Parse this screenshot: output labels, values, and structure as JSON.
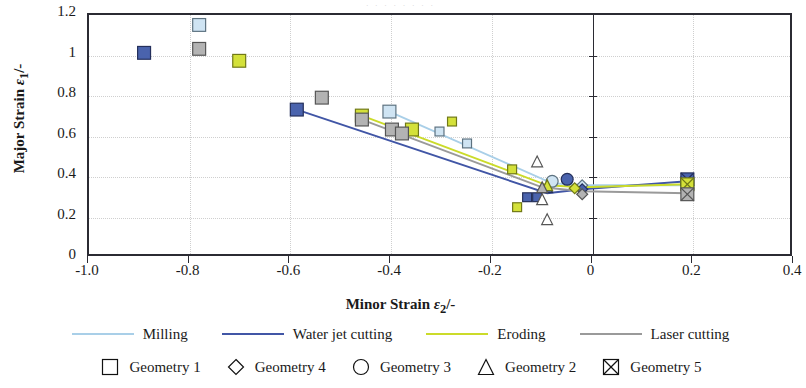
{
  "figure": {
    "top_clipped_text": "· · · · · · · ·"
  },
  "chart_data": {
    "type": "scatter",
    "title": "",
    "xlabel": "Minor Strain ε₂/-",
    "ylabel": "Major Strain ε₁/-",
    "xlabel_parts": {
      "text": "Minor Strain ",
      "symbol": "ε",
      "sub": "2",
      "suffix": "/-"
    },
    "ylabel_parts": {
      "text": "Major Strain ",
      "symbol": "ε",
      "sub": "1",
      "suffix": "/-"
    },
    "xlim": [
      -1.0,
      0.4
    ],
    "ylim": [
      0,
      1.2
    ],
    "xticks": [
      "-1.0",
      "-0.8",
      "-0.6",
      "-0.4",
      "-0.2",
      "0",
      "0.2",
      "0.4"
    ],
    "xtick_values": [
      -1.0,
      -0.8,
      -0.6,
      -0.4,
      -0.2,
      0,
      0.2,
      0.4
    ],
    "yticks": [
      "0",
      "0.2",
      "0.4",
      "0.6",
      "0.8",
      "1",
      "1.2"
    ],
    "ytick_values": [
      0,
      0.2,
      0.4,
      0.6,
      0.8,
      1.0,
      1.2
    ],
    "grid": "dotted-both",
    "zero_axis_x": 0,
    "legend_position": "below-plot",
    "colors": {
      "milling": "#a9cfe8",
      "water_jet_cutting": "#4156a6",
      "eroding": "#cbdb2a",
      "laser_cutting": "#9a9a9a"
    },
    "series": [
      {
        "name": "Milling",
        "color": "#a9cfe8",
        "marker_fill": "#cfe4f3",
        "line": [
          {
            "x": -0.4,
            "y": 0.715
          },
          {
            "x": -0.075,
            "y": 0.355
          },
          {
            "x": -0.005,
            "y": 0.345
          },
          {
            "x": 0.195,
            "y": 0.345
          }
        ],
        "points": [
          {
            "x": -0.78,
            "y": 1.15,
            "geometry": "Geometry 1",
            "marker": "square"
          },
          {
            "x": -0.4,
            "y": 0.715,
            "geometry": "Geometry 1",
            "marker": "square"
          },
          {
            "x": -0.3,
            "y": 0.615,
            "geometry": "Geometry 1",
            "marker": "square"
          },
          {
            "x": -0.245,
            "y": 0.555,
            "geometry": "Geometry 1",
            "marker": "square"
          },
          {
            "x": -0.075,
            "y": 0.365,
            "geometry": "Geometry 3",
            "marker": "circle"
          },
          {
            "x": -0.015,
            "y": 0.345,
            "geometry": "Geometry 4",
            "marker": "diamond"
          },
          {
            "x": 0.195,
            "y": 0.355,
            "geometry": "Geometry 5",
            "marker": "crossbox"
          }
        ]
      },
      {
        "name": "Water jet cutting",
        "color": "#4156a6",
        "marker_fill": "#4a63ad",
        "line": [
          {
            "x": -0.585,
            "y": 0.725
          },
          {
            "x": -0.085,
            "y": 0.305
          },
          {
            "x": -0.015,
            "y": 0.325
          },
          {
            "x": 0.195,
            "y": 0.365
          }
        ],
        "points": [
          {
            "x": -0.89,
            "y": 1.01,
            "geometry": "Geometry 1",
            "marker": "square"
          },
          {
            "x": -0.585,
            "y": 0.725,
            "geometry": "Geometry 1",
            "marker": "square"
          },
          {
            "x": -0.125,
            "y": 0.285,
            "geometry": "Geometry 1",
            "marker": "square"
          },
          {
            "x": -0.105,
            "y": 0.285,
            "geometry": "Geometry 1",
            "marker": "square"
          },
          {
            "x": -0.085,
            "y": 0.335,
            "geometry": "Geometry 2",
            "marker": "triangle"
          },
          {
            "x": -0.045,
            "y": 0.375,
            "geometry": "Geometry 3",
            "marker": "circle"
          },
          {
            "x": -0.015,
            "y": 0.325,
            "geometry": "Geometry 4",
            "marker": "diamond"
          },
          {
            "x": 0.195,
            "y": 0.375,
            "geometry": "Geometry 5",
            "marker": "crossbox"
          }
        ]
      },
      {
        "name": "Eroding",
        "color": "#cbdb2a",
        "marker_fill": "#d4e13a",
        "line": [
          {
            "x": -0.455,
            "y": 0.695
          },
          {
            "x": -0.085,
            "y": 0.345
          },
          {
            "x": -0.015,
            "y": 0.335
          },
          {
            "x": 0.195,
            "y": 0.35
          }
        ],
        "points": [
          {
            "x": -0.7,
            "y": 0.97,
            "geometry": "Geometry 1",
            "marker": "square"
          },
          {
            "x": -0.455,
            "y": 0.695,
            "geometry": "Geometry 1",
            "marker": "square"
          },
          {
            "x": -0.355,
            "y": 0.625,
            "geometry": "Geometry 1",
            "marker": "square"
          },
          {
            "x": -0.275,
            "y": 0.665,
            "geometry": "Geometry 1",
            "marker": "square"
          },
          {
            "x": -0.155,
            "y": 0.425,
            "geometry": "Geometry 1",
            "marker": "square"
          },
          {
            "x": -0.145,
            "y": 0.235,
            "geometry": "Geometry 1",
            "marker": "square"
          },
          {
            "x": -0.085,
            "y": 0.345,
            "geometry": "Geometry 2",
            "marker": "triangle"
          },
          {
            "x": -0.03,
            "y": 0.33,
            "geometry": "Geometry 4",
            "marker": "diamond"
          },
          {
            "x": 0.195,
            "y": 0.35,
            "geometry": "Geometry 5",
            "marker": "crossbox"
          }
        ]
      },
      {
        "name": "Laser cutting",
        "color": "#9a9a9a",
        "marker_fill": "#b3b3b3",
        "line": [
          {
            "x": -0.455,
            "y": 0.675
          },
          {
            "x": -0.095,
            "y": 0.335
          },
          {
            "x": -0.015,
            "y": 0.315
          },
          {
            "x": 0.195,
            "y": 0.305
          }
        ],
        "points": [
          {
            "x": -0.78,
            "y": 1.03,
            "geometry": "Geometry 1",
            "marker": "square"
          },
          {
            "x": -0.535,
            "y": 0.785,
            "geometry": "Geometry 1",
            "marker": "square"
          },
          {
            "x": -0.455,
            "y": 0.675,
            "geometry": "Geometry 1",
            "marker": "square"
          },
          {
            "x": -0.395,
            "y": 0.625,
            "geometry": "Geometry 1",
            "marker": "square"
          },
          {
            "x": -0.375,
            "y": 0.605,
            "geometry": "Geometry 1",
            "marker": "square"
          },
          {
            "x": -0.095,
            "y": 0.335,
            "geometry": "Geometry 2",
            "marker": "triangle"
          },
          {
            "x": -0.015,
            "y": 0.3,
            "geometry": "Geometry 4",
            "marker": "diamond"
          },
          {
            "x": 0.195,
            "y": 0.3,
            "geometry": "Geometry 5",
            "marker": "crossbox"
          }
        ]
      }
    ],
    "extra_points": [
      {
        "x": -0.105,
        "y": 0.465,
        "geometry": "Geometry 2",
        "marker": "triangle",
        "color": "#555555"
      },
      {
        "x": -0.095,
        "y": 0.275,
        "geometry": "Geometry 2",
        "marker": "triangle",
        "color": "#555555"
      },
      {
        "x": -0.085,
        "y": 0.175,
        "geometry": "Geometry 2",
        "marker": "triangle",
        "color": "#555555"
      }
    ]
  },
  "line_legend": {
    "items": [
      {
        "label": "Milling",
        "color": "#a9cfe8"
      },
      {
        "label": "Water jet cutting",
        "color": "#4156a6"
      },
      {
        "label": "Eroding",
        "color": "#cbdb2a"
      },
      {
        "label": "Laser cutting",
        "color": "#9a9a9a"
      }
    ]
  },
  "marker_legend": {
    "items": [
      {
        "label": "Geometry 1",
        "marker": "square"
      },
      {
        "label": "Geometry 4",
        "marker": "diamond"
      },
      {
        "label": "Geometry 3",
        "marker": "circle"
      },
      {
        "label": "Geometry 2",
        "marker": "triangle"
      },
      {
        "label": "Geometry 5",
        "marker": "crossbox"
      }
    ]
  }
}
